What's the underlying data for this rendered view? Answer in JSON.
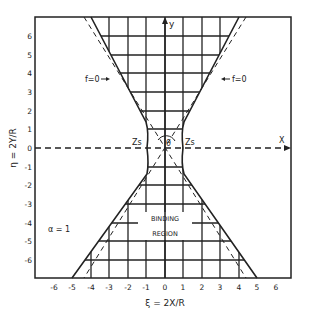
{
  "figure": {
    "x_axis_label": "ξ = 2X/R",
    "y_axis_label": "η = 2Y/R",
    "x_axis_arrow_label": "X",
    "y_axis_arrow_label": "y",
    "x_ticks": [
      "-6",
      "-5",
      "-4",
      "-3",
      "-2",
      "-1",
      "0",
      "1",
      "2",
      "3",
      "4",
      "5",
      "6"
    ],
    "y_ticks": [
      "6",
      "5",
      "4",
      "3",
      "2",
      "1",
      "0",
      "-1",
      "-2",
      "-3",
      "-4",
      "-5",
      "-6"
    ],
    "region_label_line1": "BINDING",
    "region_label_line2": "REGION",
    "parameter_label": "α = 1",
    "boundary_label_left": "f=0",
    "boundary_label_right": "f=0",
    "saddle_label_left": "Zs",
    "saddle_label_right": "Zs",
    "angle_label": "θ",
    "line_color": "#222222",
    "background_color": "#ffffff"
  }
}
